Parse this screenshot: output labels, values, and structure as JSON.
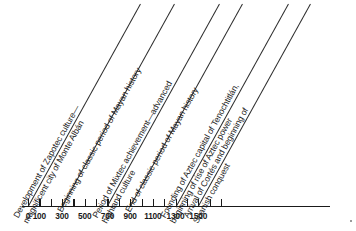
{
  "figure": {
    "kind": "timeline",
    "title": "",
    "axis": {
      "name": "years-axis",
      "min": 0,
      "max": 1800,
      "tick_interval": 100,
      "label_interval": 200,
      "tick_labels": [
        "0",
        "100",
        "300",
        "500",
        "700",
        "900",
        "1100",
        "1300",
        "1500"
      ],
      "tick_label_years": [
        0,
        100,
        300,
        500,
        700,
        900,
        1100,
        1300,
        1500
      ],
      "tick_years": [
        0,
        100,
        200,
        300,
        400,
        500,
        600,
        700,
        800,
        900,
        1000,
        1100,
        1200,
        1300,
        1400,
        1500,
        1600,
        1700
      ],
      "line_color": "#1a1a1a"
    },
    "events": [
      {
        "year": 0,
        "lines": [
          "Development of Zapotec culture—",
          "magnificent city of Monte Albán"
        ],
        "text": "Development of Zapotec culture—magnificent city of Monte Albán"
      },
      {
        "year": 300,
        "lines": [
          "Beginning of classic period of Mayan history"
        ],
        "text": "Beginning of classic period of Mayan history"
      },
      {
        "year": 700,
        "lines": [
          "Period of Mixtec achievement—advanced",
          "highland culture"
        ],
        "text": "Period of Mixtec achievement—advanced highland culture"
      },
      {
        "year": 900,
        "lines": [
          "End of classic period of Mayan history"
        ],
        "text": "End of classic period of Mayan history"
      },
      {
        "year": 1300,
        "lines": [
          "Founding of Aztec capital of Tenochtitlán,",
          "beginning of rise of Aztec power"
        ],
        "text": "Founding of Aztec capital of Tenochtitlán, beginning of rise of Aztec power"
      },
      {
        "year": 1500,
        "lines": [
          "Arrival of Cortés and beginning of",
          "Spanish conquest"
        ],
        "text": "Arrival of Cortés and beginning of Spanish conquest"
      }
    ]
  },
  "chart_data": {
    "type": "timeline",
    "title": "",
    "xlabel": "",
    "ylabel": "",
    "xlim": [
      0,
      1800
    ],
    "grid": false,
    "legend": "none",
    "tick_interval": 100,
    "labeled_ticks": [
      0,
      100,
      300,
      500,
      700,
      900,
      1100,
      1300,
      1500
    ],
    "x": [
      0,
      300,
      700,
      900,
      1300,
      1500
    ],
    "annotations": [
      "Development of Zapotec culture—magnificent city of Monte Albán",
      "Beginning of classic period of Mayan history",
      "Period of Mixtec achievement—advanced highland culture",
      "End of classic period of Mayan history",
      "Founding of Aztec capital of Tenochtitlán, beginning of rise of Aztec power",
      "Arrival of Cortés and beginning of Spanish conquest"
    ]
  }
}
